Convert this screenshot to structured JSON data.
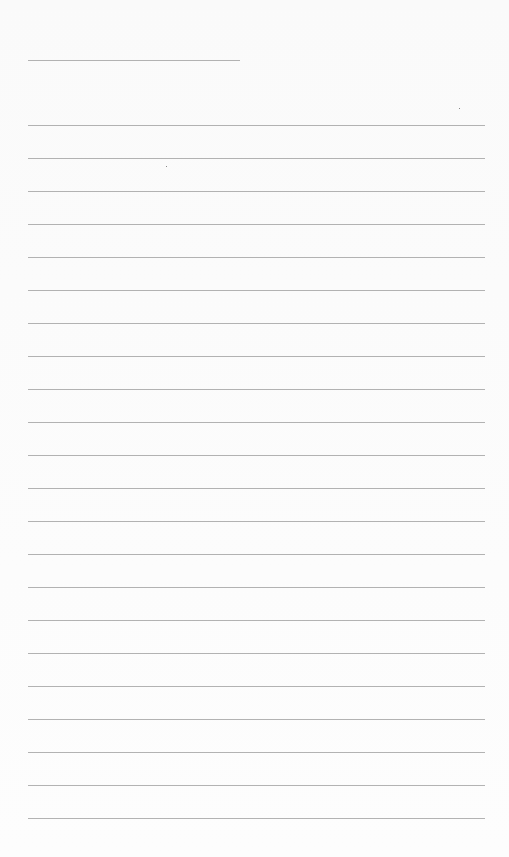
{
  "page": {
    "type": "lined-notebook-page",
    "background": "#fbfbfb",
    "line_color": "#9a9a9a"
  },
  "title_line": {
    "x1": 28,
    "x2": 240,
    "y": 60
  },
  "ruled_lines": {
    "x1": 28,
    "x2": 485,
    "first_y": 125,
    "spacing": 33,
    "count": 22
  },
  "text": []
}
